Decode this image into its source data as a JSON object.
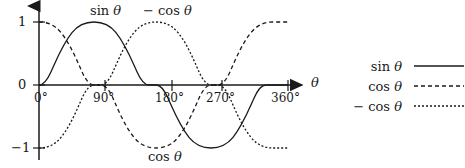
{
  "chart_data": {
    "type": "line",
    "title": "",
    "xlabel": "θ",
    "ylabel": "",
    "xlim": [
      0,
      360
    ],
    "ylim": [
      -1,
      1
    ],
    "grid": false,
    "legend_position": "right",
    "x_tick_labels": [
      "0°",
      "90°",
      "180°",
      "270°",
      "360°"
    ],
    "x_tick_values": [
      0,
      90,
      180,
      270,
      360
    ],
    "y_tick_labels": [
      "1",
      "0",
      "-1"
    ],
    "y_tick_values": [
      1,
      0,
      -1
    ],
    "series": [
      {
        "name": "sin θ",
        "style": "solid",
        "x": [
          0,
          15,
          30,
          45,
          60,
          75,
          90,
          105,
          120,
          135,
          150,
          165,
          180,
          195,
          210,
          225,
          240,
          255,
          270,
          285,
          300,
          315,
          330,
          345,
          360
        ],
        "values": [
          0,
          0.259,
          0.5,
          0.707,
          0.866,
          0.966,
          1,
          0.966,
          0.866,
          0.707,
          0.5,
          0.259,
          0,
          -0.259,
          -0.5,
          -0.707,
          -0.866,
          -0.966,
          -1,
          -0.966,
          -0.866,
          -0.707,
          -0.5,
          -0.259,
          0
        ]
      },
      {
        "name": "cos θ",
        "style": "dashed",
        "x": [
          0,
          15,
          30,
          45,
          60,
          75,
          90,
          105,
          120,
          135,
          150,
          165,
          180,
          195,
          210,
          225,
          240,
          255,
          270,
          285,
          300,
          315,
          330,
          345,
          360
        ],
        "values": [
          1,
          0.966,
          0.866,
          0.707,
          0.5,
          0.259,
          0,
          -0.259,
          -0.5,
          -0.707,
          -0.866,
          -0.966,
          -1,
          -0.966,
          -0.866,
          -0.707,
          -0.5,
          -0.259,
          0,
          0.259,
          0.5,
          0.707,
          0.866,
          0.966,
          1
        ]
      },
      {
        "name": "- cos θ",
        "style": "dotted",
        "x": [
          0,
          15,
          30,
          45,
          60,
          75,
          90,
          105,
          120,
          135,
          150,
          165,
          180,
          195,
          210,
          225,
          240,
          255,
          270,
          285,
          300,
          315,
          330,
          345,
          360
        ],
        "values": [
          -1,
          -0.966,
          -0.866,
          -0.707,
          -0.5,
          -0.259,
          0,
          0.259,
          0.5,
          0.707,
          0.866,
          0.966,
          1,
          0.966,
          0.866,
          0.707,
          0.5,
          0.259,
          0,
          -0.259,
          -0.5,
          -0.707,
          -0.866,
          -0.966,
          -1
        ]
      }
    ],
    "annotations": [
      {
        "text": "sin θ",
        "x": 90,
        "y": 1.05
      },
      {
        "text": "- cos θ",
        "x": 180,
        "y": 1.05
      },
      {
        "text": "cos θ",
        "x": 180,
        "y": -1.25
      }
    ]
  },
  "axes": {
    "x_axis_name": "θ",
    "x_ticks": [
      {
        "label": "0°"
      },
      {
        "label": "90°"
      },
      {
        "label": "180°"
      },
      {
        "label": "270°"
      },
      {
        "label": "360°"
      }
    ],
    "y_ticks": [
      {
        "label": "1"
      },
      {
        "label": "0"
      },
      {
        "label": "−1"
      }
    ]
  },
  "curve_labels": {
    "sin": "sin θ",
    "neg_cos": "− cos θ",
    "cos": "cos θ"
  },
  "legend": {
    "entries": [
      {
        "label": "sin θ",
        "style": "solid"
      },
      {
        "label": "cos θ",
        "style": "dashed"
      },
      {
        "label": "− cos θ",
        "style": "dotted"
      }
    ]
  },
  "colors": {
    "stroke": "#1a1a1a",
    "background": "#ffffff"
  }
}
